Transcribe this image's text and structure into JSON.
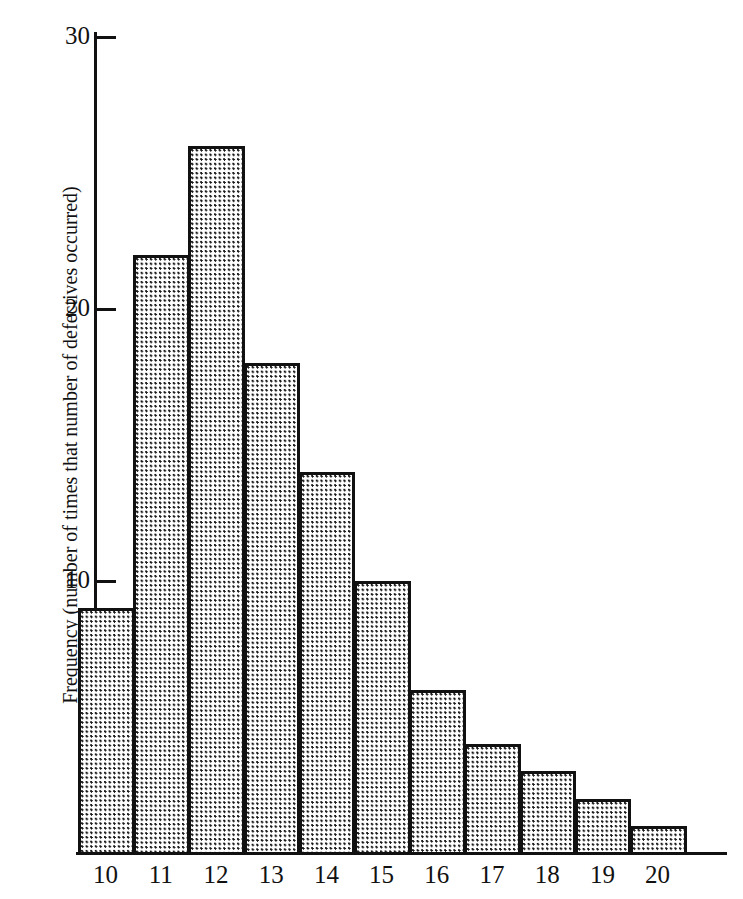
{
  "chart_data": {
    "type": "bar",
    "title": "",
    "subtitle": "",
    "xlabel": "",
    "ylabel": "Frequency (number of times that number of defectives occurred)",
    "categories": [
      "10",
      "11",
      "12",
      "13",
      "14",
      "15",
      "16",
      "17",
      "18",
      "19",
      "20"
    ],
    "values": [
      9,
      22,
      26,
      18,
      14,
      10,
      6,
      4,
      3,
      2,
      1
    ],
    "series": [
      {
        "name": "Frequency",
        "values": [
          9,
          22,
          26,
          18,
          14,
          10,
          6,
          4,
          3,
          2,
          1
        ]
      }
    ],
    "ylim": [
      0,
      30
    ],
    "yticks": [
      10,
      20,
      30
    ],
    "ytick_labels": [
      "10",
      "20",
      "30"
    ],
    "xtick_labels": [
      "10",
      "11",
      "12",
      "13",
      "14",
      "15",
      "16",
      "17",
      "18",
      "19",
      "20"
    ],
    "grid": false,
    "legend": false,
    "legend_position": "none",
    "bar_fill": "dotted-stipple",
    "bar_fill_color": "#1a1a1a",
    "bar_edge_color": "#111111",
    "background_color": "#ffffff",
    "axis_color": "#111111"
  },
  "axis": {
    "y_title": "Frequency (number of times that number of defectives occurred)",
    "ticks": [
      {
        "label": "30",
        "value": 30
      },
      {
        "label": "20",
        "value": 20
      },
      {
        "label": "10",
        "value": 10
      }
    ]
  },
  "bars": [
    {
      "category": "10",
      "value": 9
    },
    {
      "category": "11",
      "value": 22
    },
    {
      "category": "12",
      "value": 26
    },
    {
      "category": "13",
      "value": 18
    },
    {
      "category": "14",
      "value": 14
    },
    {
      "category": "15",
      "value": 10
    },
    {
      "category": "16",
      "value": 6
    },
    {
      "category": "17",
      "value": 4
    },
    {
      "category": "18",
      "value": 3
    },
    {
      "category": "19",
      "value": 2
    },
    {
      "category": "20",
      "value": 1
    }
  ]
}
